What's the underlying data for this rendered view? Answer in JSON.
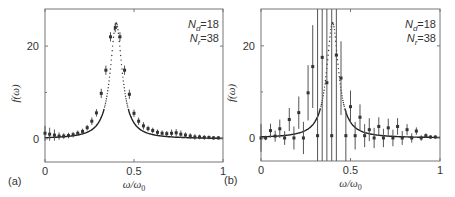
{
  "chart_data": [
    {
      "type": "scatter",
      "panel_label": "(a)",
      "title": "",
      "xlabel": "ω/ω0",
      "ylabel": "f(ω)",
      "xlim": [
        0,
        1
      ],
      "ylim": [
        -5,
        28
      ],
      "xticks": [
        0,
        0.5,
        1
      ],
      "xtick_labels": [
        "0",
        "0.5",
        "1"
      ],
      "yticks": [
        0,
        20
      ],
      "ytick_labels": [
        "0",
        "20"
      ],
      "grid": false,
      "annotation": {
        "line1": "Nd=18",
        "line2": "Nr=38"
      },
      "series": [
        {
          "name": "exact (Lorentzian, dotted/solid)",
          "style": "curve",
          "center": 0.4,
          "peak": 25,
          "halfwidth": 0.04
        },
        {
          "name": "reconstruction with error bars",
          "style": "errorbar",
          "x": [
            0.0,
            0.026,
            0.053,
            0.079,
            0.105,
            0.132,
            0.158,
            0.184,
            0.211,
            0.237,
            0.263,
            0.289,
            0.316,
            0.342,
            0.368,
            0.395,
            0.421,
            0.447,
            0.474,
            0.5,
            0.526,
            0.553,
            0.579,
            0.605,
            0.632,
            0.658,
            0.684,
            0.711,
            0.737,
            0.763,
            0.789,
            0.816,
            0.842,
            0.868,
            0.895,
            0.921,
            0.947,
            0.974
          ],
          "y": [
            1.2,
            1.0,
            0.8,
            0.6,
            0.6,
            0.7,
            0.9,
            1.2,
            1.6,
            2.4,
            3.8,
            5.6,
            9.8,
            14.8,
            22.0,
            24.0,
            22.0,
            14.8,
            9.6,
            5.5,
            3.8,
            2.8,
            2.2,
            1.8,
            1.4,
            1.2,
            1.1,
            1.2,
            1.3,
            1.0,
            0.8,
            0.6,
            0.4,
            0.4,
            0.3,
            0.3,
            0.2,
            0.2
          ],
          "err": [
            1.6,
            1.4,
            1.2,
            0.8,
            0.6,
            0.6,
            0.6,
            0.6,
            0.6,
            0.6,
            0.8,
            0.8,
            1.0,
            1.0,
            1.0,
            1.0,
            1.0,
            1.0,
            1.0,
            0.8,
            0.8,
            0.8,
            0.6,
            0.6,
            0.6,
            0.6,
            0.6,
            0.8,
            0.8,
            0.8,
            0.6,
            0.6,
            0.6,
            0.5,
            0.5,
            0.4,
            0.4,
            0.4
          ]
        }
      ]
    },
    {
      "type": "scatter",
      "panel_label": "(b)",
      "title": "",
      "xlabel": "ω/ω0",
      "ylabel": "f(ω)",
      "xlim": [
        0,
        1
      ],
      "ylim": [
        -5,
        28
      ],
      "xticks": [
        0,
        0.5,
        1
      ],
      "xtick_labels": [
        "0",
        "0.5",
        "1"
      ],
      "yticks": [
        0,
        20
      ],
      "ytick_labels": [
        "0",
        "20"
      ],
      "grid": false,
      "annotation": {
        "line1": "Nd=18",
        "line2": "Nr=38"
      },
      "series": [
        {
          "name": "exact (Lorentzian, dotted/solid)",
          "style": "curve",
          "center": 0.4,
          "peak": 25,
          "halfwidth": 0.04
        },
        {
          "name": "reconstruction with error bars",
          "style": "errorbar",
          "x": [
            0.0,
            0.026,
            0.053,
            0.079,
            0.105,
            0.132,
            0.158,
            0.184,
            0.211,
            0.237,
            0.263,
            0.289,
            0.316,
            0.342,
            0.368,
            0.395,
            0.421,
            0.447,
            0.474,
            0.5,
            0.526,
            0.553,
            0.579,
            0.605,
            0.632,
            0.658,
            0.684,
            0.711,
            0.737,
            0.763,
            0.789,
            0.816,
            0.842,
            0.868,
            0.895,
            0.921,
            0.947,
            0.974
          ],
          "y": [
            0.0,
            0.0,
            1.6,
            0.4,
            2.0,
            0.0,
            4.0,
            0.0,
            5.5,
            0.0,
            9.8,
            15.5,
            0.5,
            17.5,
            12.0,
            0.5,
            18.0,
            13.0,
            0.5,
            6.8,
            0.5,
            4.5,
            0.5,
            1.8,
            0.0,
            2.5,
            0.0,
            2.2,
            0.0,
            2.5,
            0.0,
            1.8,
            0.0,
            1.5,
            0.0,
            0.5,
            0.2,
            0.2
          ],
          "err": [
            3.0,
            0.5,
            1.5,
            1.2,
            2.0,
            1.5,
            2.5,
            2.5,
            3.5,
            3.5,
            6.0,
            9.0,
            30.0,
            30.0,
            30.0,
            30.0,
            30.0,
            8.0,
            5.5,
            3.5,
            3.0,
            2.8,
            2.5,
            2.5,
            2.2,
            2.0,
            2.0,
            2.0,
            1.8,
            1.8,
            1.5,
            1.2,
            1.0,
            0.8,
            0.6,
            0.5,
            0.4,
            0.4
          ]
        }
      ]
    }
  ]
}
